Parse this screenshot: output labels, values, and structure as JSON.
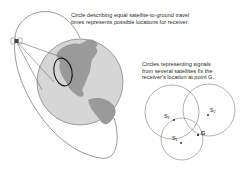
{
  "captions": {
    "orbit": {
      "line1": "Circle describing equal satellite-to-ground travel",
      "line2": "times represents possible locations for receiver."
    },
    "signals": {
      "line1": "Circles representing signals",
      "line2": "from several satellites fix the",
      "line3": "receiver's location at point G."
    }
  },
  "labels": {
    "s3": {
      "base": "S",
      "sub": "3"
    },
    "s2": {
      "base": "S",
      "sub": "2"
    },
    "s1": {
      "base": "S",
      "sub": "1"
    },
    "g": "G"
  },
  "colors": {
    "ocean": "#d4d4d4",
    "land": "#9a9a9a",
    "stroke": "#555555",
    "receiver_ring": "#1a1a1a"
  }
}
